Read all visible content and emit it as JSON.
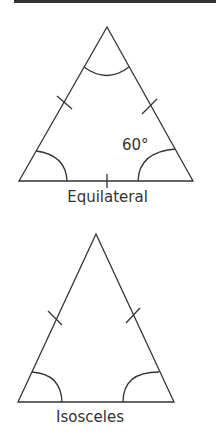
{
  "diagram": {
    "triangles": [
      {
        "name": "Equilateral",
        "label": "Equilateral",
        "angle_label": "60°",
        "vertices": {
          "apex": [
            107,
            27
          ],
          "left": [
            19,
            181
          ],
          "right": [
            193,
            181
          ]
        },
        "equal_sides_marked": 3,
        "equal_angles_marked": 3
      },
      {
        "name": "Isosceles",
        "label": "Isosceles",
        "vertices": {
          "apex": [
            96,
            234
          ],
          "left": [
            18,
            402
          ],
          "right": [
            174,
            402
          ]
        },
        "equal_sides_marked": 2,
        "equal_angles_marked": 2
      }
    ],
    "colors": {
      "line": "#333333",
      "background": "#ffffff"
    }
  }
}
